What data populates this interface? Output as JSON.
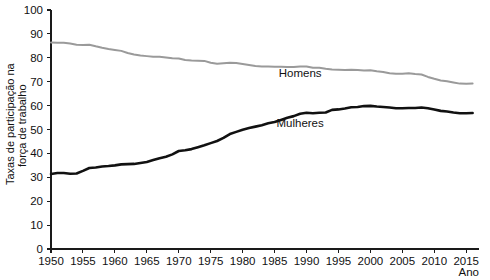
{
  "chart_data": {
    "type": "line",
    "title": "",
    "xlabel": "Ano",
    "ylabel": "Taxas de participação na força de trabalho",
    "ylabel_line1": "Taxas de participação na",
    "ylabel_line2": "força de trabalho",
    "xlim": [
      1950,
      2017
    ],
    "ylim": [
      0,
      100
    ],
    "ytick_step": 10,
    "xtick_step": 5,
    "grid": false,
    "legend_position": "inline-annotations",
    "yticks": [
      0,
      10,
      20,
      30,
      40,
      50,
      60,
      70,
      80,
      90,
      100
    ],
    "xticks": [
      1950,
      1955,
      1960,
      1965,
      1970,
      1975,
      1980,
      1985,
      1990,
      1995,
      2000,
      2005,
      2010,
      2015
    ],
    "annotations": [
      {
        "text": "Homens",
        "x": 1989,
        "y": 72,
        "series": "Homens"
      },
      {
        "text": "Mulheres",
        "x": 1989,
        "y": 51,
        "series": "Mulheres"
      }
    ],
    "x": [
      1950,
      1951,
      1952,
      1953,
      1954,
      1955,
      1956,
      1957,
      1958,
      1959,
      1960,
      1961,
      1962,
      1963,
      1964,
      1965,
      1966,
      1967,
      1968,
      1969,
      1970,
      1971,
      1972,
      1973,
      1974,
      1975,
      1976,
      1977,
      1978,
      1979,
      1980,
      1981,
      1982,
      1983,
      1984,
      1985,
      1986,
      1987,
      1988,
      1989,
      1990,
      1991,
      1992,
      1993,
      1994,
      1995,
      1996,
      1997,
      1998,
      1999,
      2000,
      2001,
      2002,
      2003,
      2004,
      2005,
      2006,
      2007,
      2008,
      2009,
      2010,
      2011,
      2012,
      2013,
      2014,
      2015,
      2016
    ],
    "series": [
      {
        "name": "Homens",
        "color": "#9a9a9a",
        "values": [
          86.4,
          86.3,
          86.3,
          86.0,
          85.5,
          85.4,
          85.5,
          84.8,
          84.2,
          83.7,
          83.3,
          82.9,
          82.0,
          81.4,
          81.0,
          80.7,
          80.4,
          80.4,
          80.1,
          79.8,
          79.7,
          79.1,
          78.9,
          78.8,
          78.7,
          77.9,
          77.5,
          77.7,
          77.9,
          77.8,
          77.4,
          77.0,
          76.6,
          76.4,
          76.4,
          76.3,
          76.3,
          76.2,
          76.2,
          76.4,
          76.4,
          75.8,
          75.8,
          75.4,
          75.1,
          75.0,
          74.9,
          75.0,
          74.9,
          74.7,
          74.8,
          74.4,
          74.1,
          73.5,
          73.3,
          73.3,
          73.5,
          73.2,
          73.0,
          72.0,
          71.2,
          70.5,
          70.2,
          69.7,
          69.2,
          69.1,
          69.2
        ]
      },
      {
        "name": "Mulheres",
        "color": "#111111",
        "values": [
          31.4,
          31.8,
          31.8,
          31.5,
          31.6,
          32.7,
          33.9,
          34.1,
          34.5,
          34.7,
          35.0,
          35.4,
          35.5,
          35.6,
          36.0,
          36.4,
          37.2,
          38.0,
          38.6,
          39.6,
          41.0,
          41.3,
          41.8,
          42.6,
          43.4,
          44.3,
          45.2,
          46.5,
          48.1,
          49.0,
          49.9,
          50.6,
          51.2,
          51.8,
          52.6,
          53.1,
          54.0,
          54.9,
          55.6,
          56.6,
          57.0,
          56.8,
          57.0,
          57.1,
          58.2,
          58.4,
          58.8,
          59.3,
          59.4,
          59.8,
          59.9,
          59.6,
          59.4,
          59.2,
          58.9,
          58.9,
          59.0,
          59.0,
          59.2,
          58.9,
          58.4,
          57.8,
          57.5,
          57.1,
          56.8,
          56.8,
          56.9
        ]
      }
    ]
  }
}
